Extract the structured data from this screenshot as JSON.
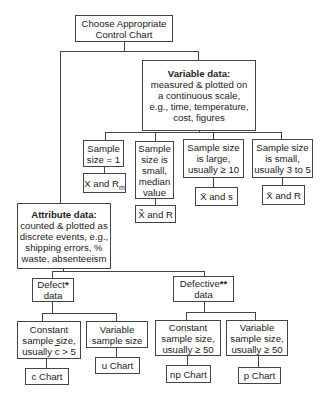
{
  "diagram": {
    "root": {
      "lines": [
        "Choose Appropriate",
        "Control Chart"
      ]
    },
    "variable": {
      "title": "Variable data:",
      "lines": [
        "measured & plotted on",
        "a continuous scale,",
        "e.g., time, temperature,",
        "cost, figures"
      ],
      "branches": [
        {
          "condition": [
            "Sample",
            "size = 1"
          ],
          "chart_main": "X and R",
          "chart_sub": "m"
        },
        {
          "condition": [
            "Sample",
            "size is",
            "small,",
            "median",
            "value"
          ],
          "chart_main": "X̃ and R"
        },
        {
          "condition": [
            "Sample size",
            "is large,",
            "usually ≥ 10"
          ],
          "chart_main": "X̄ and s"
        },
        {
          "condition": [
            "Sample size",
            "is small,",
            "usually 3 to 5"
          ],
          "chart_main": "X̄ and R"
        }
      ]
    },
    "attribute": {
      "title": "Attribute data:",
      "lines": [
        "counted & plotted as",
        "discrete events, e.g.,",
        "shipping errors, %",
        "waste, absenteeism"
      ],
      "defect": {
        "label": "Defect",
        "mark": "*",
        "label2": "data",
        "branches": [
          {
            "condition": [
              "Constant",
              "sample size,"
            ],
            "cond_prefix": "usually ",
            "cond_over": "c",
            "cond_suffix": " > 5",
            "chart": "c Chart"
          },
          {
            "condition": [
              "Variable",
              "sample size"
            ],
            "chart": "u Chart"
          }
        ]
      },
      "defective": {
        "label": "Defective",
        "mark": "**",
        "label2": "data",
        "branches": [
          {
            "condition": [
              "Constant",
              "sample size,",
              "usually ≥ 50"
            ],
            "chart": "np Chart"
          },
          {
            "condition": [
              "Variable",
              "sample size,",
              "usually ≥ 50"
            ],
            "chart": "p Chart"
          }
        ]
      }
    }
  }
}
